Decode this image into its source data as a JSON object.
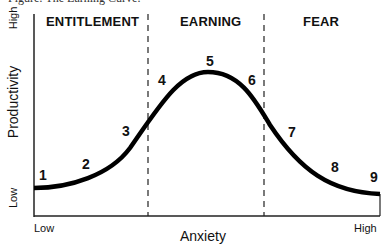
{
  "caption": "Figure: The Earning Curve.",
  "zones": [
    {
      "label": "ENTITLEMENT"
    },
    {
      "label": "EARNING"
    },
    {
      "label": "FEAR"
    }
  ],
  "axes": {
    "ylabel": "Productivity",
    "xlabel": "Anxiety",
    "y_high": "High",
    "y_low": "Low",
    "x_low": "Low",
    "x_high": "High"
  },
  "points": [
    "1",
    "2",
    "3",
    "4",
    "5",
    "6",
    "7",
    "8",
    "9"
  ]
}
